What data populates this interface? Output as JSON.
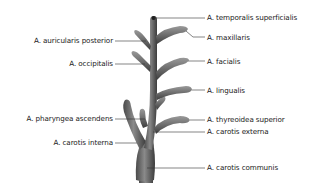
{
  "diagram": {
    "title": "",
    "labels": {
      "temporalis_superficialis": "A. temporalis superficialis",
      "maxillaris": "A. maxillaris",
      "auricularis_posterior": "A. auricularis posterior",
      "occipitalis": "A. occipitalis",
      "facialis": "A. facialis",
      "lingualis": "A. lingualis",
      "pharyngea_ascendens": "A. pharyngea ascendens",
      "thyreoidea_superior": "A. thyreoidea superior",
      "carotis_externa": "A. carotis externa",
      "carotis_interna": "A. carotis interna",
      "carotis_communis": "A. carotis communis"
    },
    "colors": {
      "vessel_dark": "#3a3a3a",
      "vessel_mid": "#6e6e6e",
      "vessel_light": "#a8a8a8",
      "leader_line": "#333333",
      "text": "#1a1a1a"
    }
  }
}
